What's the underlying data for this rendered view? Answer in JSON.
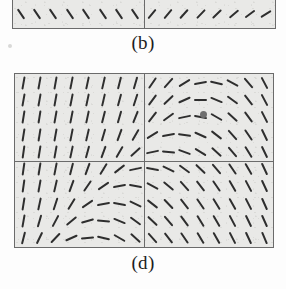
{
  "figure": {
    "background_color": "#fdfdfd",
    "panel_fill_color": "#e9e9e7",
    "panel_border_color": "#6b6b6b",
    "stroke_color": "#2e2e2e",
    "singularity_color": "#6f6f6f"
  },
  "panels": [
    {
      "id": "b",
      "caption": "(b)",
      "cropped": true,
      "grid_columns": 16,
      "grid_rows": 2,
      "divider_fraction_x": 0.5,
      "description": "partially cropped panel with two halves; left half back-slanted strokes, right half forward-slanted strokes"
    },
    {
      "id": "d",
      "caption": "(d)",
      "cropped": false,
      "grid_columns": 16,
      "grid_rows": 10,
      "divider_fraction_x": 0.5,
      "divider_fraction_y": 0.5,
      "singularity": {
        "x_fraction": 0.73,
        "y_fraction": 0.235
      },
      "description": "four-quadrant orientation field with a singularity in the upper-right quadrant"
    }
  ],
  "chart_data": {
    "type": "scatter",
    "title": "",
    "subtitle": "",
    "xlabel": "",
    "ylabel": "",
    "grid": false,
    "legend": null,
    "note": "Quiver / orientation (line-segment) field. Each value is the stroke angle in degrees measured clockwise from vertical; positive = top leans right.",
    "panel_b": {
      "caption": "(b)",
      "columns": 16,
      "rows": 2,
      "angles_deg": [
        [
          -34,
          -34,
          -34,
          -34,
          -34,
          -34,
          -34,
          -34,
          40,
          40,
          42,
          44,
          46,
          50,
          54,
          58
        ],
        [
          -36,
          -36,
          -36,
          -36,
          -34,
          -32,
          -24,
          -16,
          30,
          32,
          36,
          40,
          46,
          52,
          58,
          62
        ]
      ]
    },
    "panel_d": {
      "caption": "(d)",
      "columns": 16,
      "rows": 10,
      "x_ticks": [],
      "y_ticks": [],
      "singularity_cell": {
        "col": 11,
        "row": 2
      },
      "angles_deg": [
        [
          10,
          10,
          10,
          11,
          12,
          13,
          14,
          16,
          34,
          42,
          58,
          80,
          104,
          118,
          140,
          152
        ],
        [
          10,
          10,
          10,
          11,
          12,
          13,
          15,
          18,
          36,
          46,
          66,
          90,
          112,
          126,
          142,
          152
        ],
        [
          9,
          9,
          10,
          11,
          12,
          14,
          16,
          22,
          38,
          54,
          78,
          100,
          120,
          132,
          144,
          153
        ],
        [
          9,
          9,
          10,
          11,
          13,
          16,
          20,
          30,
          58,
          80,
          98,
          114,
          128,
          138,
          146,
          154
        ],
        [
          8,
          9,
          10,
          12,
          15,
          20,
          30,
          48,
          78,
          96,
          110,
          122,
          132,
          140,
          148,
          154
        ],
        [
          8,
          9,
          11,
          14,
          20,
          32,
          52,
          78,
          100,
          116,
          126,
          134,
          140,
          146,
          150,
          155
        ],
        [
          8,
          10,
          13,
          20,
          34,
          56,
          80,
          100,
          118,
          130,
          138,
          142,
          146,
          150,
          152,
          155
        ],
        [
          9,
          12,
          18,
          32,
          56,
          80,
          100,
          116,
          128,
          136,
          142,
          146,
          148,
          151,
          153,
          156
        ],
        [
          10,
          16,
          28,
          50,
          74,
          94,
          112,
          126,
          134,
          140,
          144,
          148,
          150,
          152,
          154,
          156
        ],
        [
          14,
          26,
          44,
          66,
          86,
          104,
          120,
          132,
          138,
          142,
          146,
          149,
          151,
          153,
          155,
          157
        ]
      ]
    }
  }
}
